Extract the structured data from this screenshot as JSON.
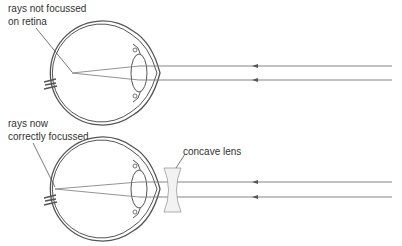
{
  "diagram": {
    "top_panel": {
      "label_line1": "rays not focussed",
      "label_line2": "on retina"
    },
    "bottom_panel": {
      "label_line1": "rays now",
      "label_line2": "correctly focussed",
      "lens_label": "concave lens"
    },
    "colors": {
      "line": "#555555",
      "ray": "#777777",
      "lens_fill": "#f2f2f2"
    }
  }
}
